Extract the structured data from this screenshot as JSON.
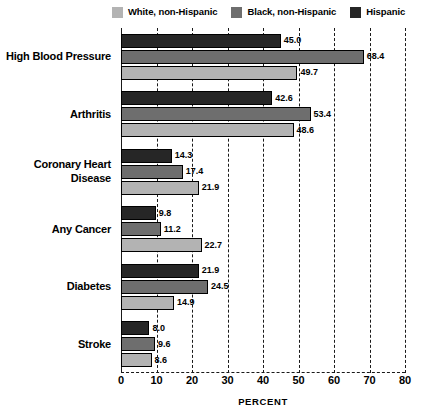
{
  "chart_data": {
    "type": "bar",
    "orientation": "horizontal",
    "title": "",
    "xlabel": "PERCENT",
    "ylabel": "",
    "xlim": [
      0,
      80
    ],
    "xticks": [
      0,
      10,
      20,
      30,
      40,
      50,
      60,
      70,
      80
    ],
    "grid": true,
    "legend_position": "top",
    "categories": [
      "High Blood Pressure",
      "Arthritis",
      "Coronary Heart Disease",
      "Any Cancer",
      "Diabetes",
      "Stroke"
    ],
    "series": [
      {
        "name": "Hispanic",
        "color": "#262626",
        "values": [
          45.0,
          42.6,
          14.3,
          9.8,
          21.9,
          8.0
        ],
        "labels": [
          "45.0",
          "42.6",
          "14.3",
          "9.8",
          "21.9",
          "8.0"
        ]
      },
      {
        "name": "Black, non-Hispanic",
        "color": "#6e6e6e",
        "values": [
          68.4,
          53.4,
          17.4,
          11.2,
          24.5,
          9.6
        ],
        "labels": [
          "68.4",
          "53.4",
          "17.4",
          "11.2",
          "24.5",
          "9.6"
        ]
      },
      {
        "name": "White, non-Hispanic",
        "color": "#b3b3b3",
        "values": [
          49.7,
          48.6,
          21.9,
          22.7,
          14.9,
          8.6
        ],
        "labels": [
          "49.7",
          "48.6",
          "21.9",
          "22.7",
          "14.9",
          "8.6"
        ]
      }
    ]
  },
  "legend": {
    "items": [
      {
        "label": "White, non-Hispanic",
        "color": "#b3b3b3"
      },
      {
        "label": "Black, non-Hispanic",
        "color": "#6e6e6e"
      },
      {
        "label": "Hispanic",
        "color": "#262626"
      }
    ]
  },
  "axis": {
    "x_title": "PERCENT",
    "x_tick_labels": [
      "0",
      "10",
      "20",
      "30",
      "40",
      "50",
      "60",
      "70",
      "80"
    ]
  },
  "category_lines": [
    [
      "High Blood Pressure"
    ],
    [
      "Arthritis"
    ],
    [
      "Coronary Heart",
      "Disease"
    ],
    [
      "Any Cancer"
    ],
    [
      "Diabetes"
    ],
    [
      "Stroke"
    ]
  ],
  "bar_order": [
    "Hispanic",
    "Black, non-Hispanic",
    "White, non-Hispanic"
  ]
}
